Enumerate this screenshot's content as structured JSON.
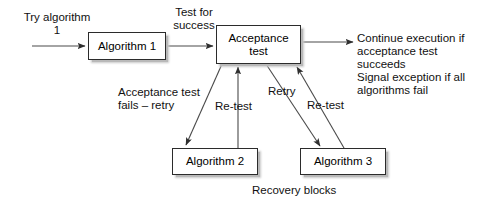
{
  "diagram": {
    "caption": "Recovery blocks",
    "colors": {
      "box_border": "#2b2b2b",
      "box_fill": "#ffffff",
      "box_shadow": "#c0c0c0",
      "line": "#4a4a4a",
      "text": "#111111",
      "background": "#ffffff"
    },
    "boxes": [
      {
        "id": "algorithm-1",
        "label": "Algorithm 1"
      },
      {
        "id": "acceptance-test",
        "label": "Acceptance\ntest"
      },
      {
        "id": "algorithm-2",
        "label": "Algorithm 2"
      },
      {
        "id": "algorithm-3",
        "label": "Algorithm 3"
      }
    ],
    "labels": {
      "try_algorithm": "Try algorithm\n1",
      "test_for_success": "Test for\nsuccess",
      "outcome": "Continue execution if\nacceptance test succeeds\nSignal exception if all\nalgorithms fail",
      "acceptance_fails": "Acceptance test\nfails – retry",
      "retest_left": "Re-test",
      "retry_right": "Retry",
      "retest_right": "Re-test"
    },
    "edges": [
      {
        "id": "start-to-algorithm-1",
        "label": "Try algorithm 1",
        "from": "start",
        "to": "algorithm-1"
      },
      {
        "id": "algorithm-1-to-acceptance-test",
        "label": "Test for success",
        "from": "algorithm-1",
        "to": "acceptance-test"
      },
      {
        "id": "acceptance-test-to-outcome",
        "label": "Continue execution if acceptance test succeeds",
        "from": "acceptance-test",
        "to": "outcome"
      },
      {
        "id": "acceptance-test-to-algorithm-2",
        "label": "Acceptance test fails – retry",
        "from": "acceptance-test",
        "to": "algorithm-2"
      },
      {
        "id": "algorithm-2-to-acceptance-test",
        "label": "Re-test",
        "from": "algorithm-2",
        "to": "acceptance-test"
      },
      {
        "id": "acceptance-test-to-algorithm-3",
        "label": "Retry",
        "from": "acceptance-test",
        "to": "algorithm-3"
      },
      {
        "id": "algorithm-3-to-acceptance-test",
        "label": "Re-test",
        "from": "algorithm-3",
        "to": "acceptance-test"
      }
    ]
  }
}
